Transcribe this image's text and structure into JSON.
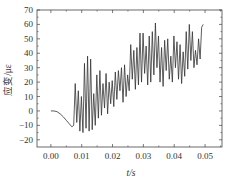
{
  "chart_data": {
    "type": "line",
    "title": "",
    "xlabel": "t/s",
    "ylabel": "应变/με",
    "xlim": [
      -0.0045,
      0.0555
    ],
    "ylim": [
      -25,
      70
    ],
    "xticks": [
      0.0,
      0.01,
      0.02,
      0.03,
      0.04,
      0.05
    ],
    "xtick_labels": [
      "0.00",
      "0.01",
      "0.02",
      "0.03",
      "0.04",
      "0.05"
    ],
    "yticks": [
      -20,
      -10,
      0,
      10,
      20,
      30,
      40,
      50,
      60,
      70
    ],
    "ytick_labels": [
      "−20",
      "−10",
      "0",
      "10",
      "20",
      "30",
      "40",
      "50",
      "60",
      "70"
    ],
    "grid": false,
    "legend": null,
    "series": [
      {
        "name": "strain",
        "color": "#333333",
        "x": [
          0.0,
          0.001,
          0.002,
          0.003,
          0.004,
          0.005,
          0.006,
          0.0068,
          0.0074,
          0.0079,
          0.0084,
          0.0089,
          0.0094,
          0.0099,
          0.0104,
          0.0109,
          0.0114,
          0.0119,
          0.0124,
          0.0129,
          0.0134,
          0.0139,
          0.0144,
          0.0149,
          0.0154,
          0.0159,
          0.0164,
          0.0169,
          0.0174,
          0.0179,
          0.0184,
          0.0189,
          0.0194,
          0.0199,
          0.0204,
          0.0209,
          0.0214,
          0.0219,
          0.0224,
          0.0229,
          0.0234,
          0.0239,
          0.0244,
          0.0249,
          0.0254,
          0.0259,
          0.0264,
          0.0269,
          0.0274,
          0.0279,
          0.0284,
          0.0289,
          0.0294,
          0.0299,
          0.0304,
          0.0309,
          0.0314,
          0.0319,
          0.0324,
          0.0329,
          0.0334,
          0.0339,
          0.0344,
          0.0349,
          0.0354,
          0.0359,
          0.0364,
          0.0369,
          0.0374,
          0.0379,
          0.0384,
          0.0389,
          0.0394,
          0.0399,
          0.0404,
          0.0409,
          0.0414,
          0.0419,
          0.0424,
          0.0429,
          0.0434,
          0.0439,
          0.0444,
          0.0449,
          0.0454,
          0.0459,
          0.0464,
          0.0469,
          0.0474,
          0.0479,
          0.0484,
          0.0489,
          0.0494
        ],
        "y": [
          0,
          0,
          -0.5,
          -2,
          -4,
          -6.5,
          -9,
          -11,
          -10,
          19,
          -8,
          14,
          -14,
          10,
          -15,
          33,
          -12,
          38,
          -14,
          36,
          -13,
          12,
          -10,
          25,
          -5,
          28,
          -3,
          19,
          2,
          26,
          -2,
          20,
          5,
          21,
          3,
          27,
          8,
          28,
          14,
          30,
          6,
          32,
          10,
          25,
          14,
          46,
          22,
          42,
          15,
          44,
          18,
          54,
          20,
          54,
          26,
          45,
          18,
          52,
          20,
          55,
          25,
          61,
          30,
          52,
          20,
          44,
          17,
          49,
          28,
          50,
          22,
          38,
          20,
          52,
          30,
          48,
          22,
          46,
          19,
          41,
          24,
          55,
          29,
          60,
          35,
          55,
          30,
          42,
          32,
          50,
          36,
          58,
          60
        ]
      }
    ]
  }
}
